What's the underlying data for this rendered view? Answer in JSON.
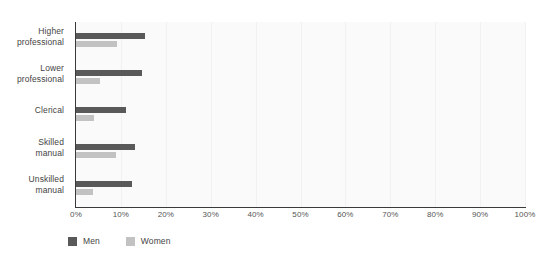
{
  "chart_data": {
    "type": "bar",
    "orientation": "horizontal",
    "title": "",
    "subtitle": "",
    "xlabel": "",
    "ylabel": "",
    "categories": [
      "Higher professional",
      "Lower professional",
      "Clerical",
      "Skilled manual",
      "Unskilled manual"
    ],
    "category_lines": [
      [
        "Higher",
        "professional"
      ],
      [
        "Lower",
        "professional"
      ],
      [
        "Clerical",
        ""
      ],
      [
        "Skilled",
        "manual"
      ],
      [
        "Unskilled",
        "manual"
      ]
    ],
    "series": [
      {
        "name": "Men",
        "color": "#595959",
        "values": [
          15.4,
          14.6,
          11.1,
          13.2,
          12.4
        ]
      },
      {
        "name": "Women",
        "color": "#c2c2c2",
        "values": [
          9.2,
          5.3,
          4.0,
          8.9,
          3.7
        ]
      }
    ],
    "xlim": [
      0,
      100
    ],
    "xticks": [
      0,
      10,
      20,
      30,
      40,
      50,
      60,
      70,
      80,
      90,
      100
    ],
    "xtick_labels": [
      "0%",
      "10%",
      "20%",
      "30%",
      "40%",
      "50%",
      "60%",
      "70%",
      "80%",
      "90%",
      "100%"
    ],
    "grid": "vertical-light",
    "legend_position": "bottom-left",
    "plot_background": "#fafafa",
    "axis_color": "#3a3a3a"
  },
  "legend": {
    "entries": [
      {
        "label": "Men",
        "color": "#595959"
      },
      {
        "label": "Women",
        "color": "#c2c2c2"
      }
    ]
  }
}
